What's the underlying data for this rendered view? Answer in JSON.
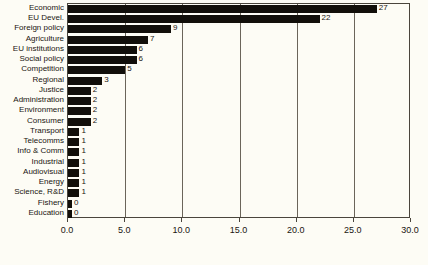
{
  "chart_data": {
    "type": "bar",
    "orientation": "horizontal",
    "title": "",
    "subtitle": "",
    "xlabel": "",
    "ylabel": "",
    "xlim": [
      0.0,
      30.0
    ],
    "xticks": [
      "0.0",
      "5.0",
      "10.0",
      "15.0",
      "20.0",
      "25.0",
      "30.0"
    ],
    "xtick_values": [
      0,
      5,
      10,
      15,
      20,
      25,
      30
    ],
    "grid": true,
    "grid_axis": "x",
    "legend": false,
    "legend_position": "none",
    "bar_color": "#120f0a",
    "background_color": "#fdfcf5",
    "frame_color": "#4a453c",
    "categories": [
      "Economic",
      "EU Devel.",
      "Foreign policy",
      "Agriculture",
      "EU institutions",
      "Social policy",
      "Competition",
      "Regional",
      "Justice",
      "Administration",
      "Environment",
      "Consumer",
      "Transport",
      "Telecomms",
      "Info & Comm",
      "Industrial",
      "Audiovisual",
      "Energy",
      "Science, R&D",
      "Fishery",
      "Education"
    ],
    "values": [
      27,
      22,
      9,
      7,
      6,
      6,
      5,
      3,
      2,
      2,
      2,
      2,
      1,
      1,
      1,
      1,
      1,
      1,
      1,
      0,
      0
    ],
    "value_labels": [
      "27",
      "22",
      "9",
      "7",
      "6",
      "6",
      "5",
      "3",
      "2",
      "2",
      "2",
      "2",
      "1",
      "1",
      "1",
      "1",
      "1",
      "1",
      "1",
      "0",
      "0"
    ]
  }
}
